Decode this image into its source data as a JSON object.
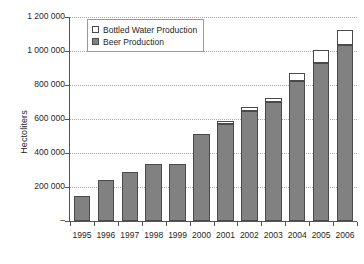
{
  "chart_data": {
    "type": "bar",
    "subtype": "stacked",
    "title": "",
    "xlabel": "",
    "ylabel": "Hectoliters",
    "categories": [
      "1995",
      "1996",
      "1997",
      "1998",
      "1999",
      "2000",
      "2001",
      "2002",
      "2003",
      "2004",
      "2005",
      "2006"
    ],
    "series": [
      {
        "name": "Beer Production",
        "color": "#818181",
        "values": [
          150000,
          240000,
          290000,
          335000,
          337000,
          510000,
          573000,
          650000,
          700000,
          825000,
          928000,
          1033000
        ]
      },
      {
        "name": "Bottled Water Production",
        "color": "#ffffff",
        "values": [
          0,
          0,
          0,
          0,
          0,
          0,
          13000,
          18000,
          25000,
          45000,
          80000,
          90000
        ]
      }
    ],
    "totals": [
      150000,
      240000,
      290000,
      335000,
      337000,
      510000,
      586000,
      668000,
      725000,
      870000,
      1008000,
      1123000
    ],
    "ylim": [
      0,
      1200000
    ],
    "ytick_values": [
      0,
      200000,
      400000,
      600000,
      800000,
      1000000,
      1200000
    ],
    "ytick_labels": [
      "–",
      "200 000",
      "400 000",
      "600 000",
      "800 000",
      "1 000 000",
      "1 200 000"
    ],
    "grid": true,
    "grid_axis": "y",
    "legend_position": "top-left-inside",
    "legend_entries": [
      {
        "label": "Bottled Water Production",
        "swatch": "white"
      },
      {
        "label": "Beer Production",
        "swatch": "gray"
      }
    ]
  },
  "axis": {
    "y_title": "Hectoliters"
  },
  "colors": {
    "beer": "#818181",
    "water": "#ffffff",
    "bar_outline": "#4a4a4a",
    "axis": "#545454",
    "grid": "#a8a8a8",
    "text": "#262626",
    "background": "#ffffff"
  }
}
